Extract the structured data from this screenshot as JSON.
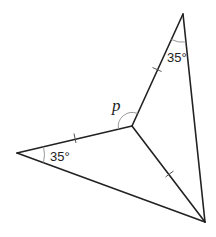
{
  "diagram": {
    "type": "geometry",
    "labels": {
      "angle_top": "35°",
      "angle_left": "35°",
      "unknown_angle": "p"
    },
    "vertices": {
      "top": [
        183,
        14
      ],
      "center": [
        132,
        126
      ],
      "left": [
        17,
        153
      ],
      "bottom": [
        205,
        222
      ]
    },
    "equal_segments": [
      "top-center",
      "center-left",
      "center-bottom"
    ],
    "colors": {
      "line": "#222222",
      "arc": "#999999",
      "tick": "#555555"
    }
  }
}
